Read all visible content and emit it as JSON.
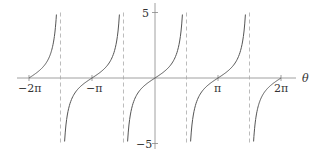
{
  "chart_data": {
    "type": "line",
    "title": "",
    "function": "tan(theta)",
    "xlabel": "θ",
    "ylabel": "",
    "xlim": [
      -6.2832,
      6.2832
    ],
    "ylim": [
      -5,
      5
    ],
    "x_ticks": [
      {
        "value": -6.2832,
        "label": "−2π"
      },
      {
        "value": -3.1416,
        "label": "−π"
      },
      {
        "value": 3.1416,
        "label": "π"
      },
      {
        "value": 6.2832,
        "label": "2π"
      }
    ],
    "y_ticks": [
      {
        "value": 5,
        "label": "5"
      },
      {
        "value": -5,
        "label": "−5"
      }
    ],
    "asymptotes": [
      -4.7124,
      -1.5708,
      1.5708,
      4.7124
    ],
    "asymptote_style": "dashed",
    "grid": false,
    "legend": null,
    "series": [
      {
        "name": "tan θ",
        "x_range": [
          -6.2832,
          -4.9159
        ],
        "description": "branch rising from 0 at -2π toward +5 near -3π/2"
      },
      {
        "name": "tan θ",
        "x_range": [
          -4.5089,
          -1.7743
        ],
        "description": "branch from -5 through 0 at -π to +5"
      },
      {
        "name": "tan θ",
        "x_range": [
          -1.3673,
          1.3673
        ],
        "description": "branch from -5 through 0 at 0 to +5"
      },
      {
        "name": "tan θ",
        "x_range": [
          1.7743,
          4.5089
        ],
        "description": "branch from -5 through 0 at π to +5"
      },
      {
        "name": "tan θ",
        "x_range": [
          4.9159,
          6.2832
        ],
        "description": "branch from -5 rising to 0 at 2π"
      }
    ],
    "colors": {
      "curve": "#555555",
      "axis": "#888888",
      "asymptote": "#aaaaaa"
    }
  },
  "labels": {
    "x_neg_2pi": "−2π",
    "x_neg_pi": "−π",
    "x_pi": "π",
    "x_2pi": "2π",
    "axis_theta": "θ",
    "y_pos5": "5",
    "y_neg5": "−5"
  }
}
